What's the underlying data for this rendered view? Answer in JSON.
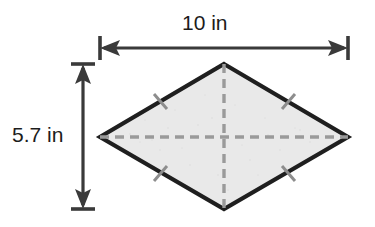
{
  "figure": {
    "name": "rhombus-diagonals-diagram",
    "shape_label": "rhombus",
    "fill_color": "#e9e9e9",
    "outline_color": "#1f1f1f",
    "dash_color": "#9a9a9a",
    "tick_color": "#8d8d8d",
    "dimension_color": "#3a3a3a",
    "background_color": "#ffffff",
    "vertices": {
      "top": [
        224,
        64
      ],
      "right": [
        348,
        137
      ],
      "bottom": [
        224,
        209
      ],
      "left": [
        100,
        137
      ]
    },
    "diagonals": [
      {
        "name": "horizontal-diagonal",
        "style": "dashed",
        "from": [
          100,
          137
        ],
        "to": [
          348,
          137
        ]
      },
      {
        "name": "vertical-diagonal",
        "style": "dashed",
        "from": [
          224,
          64
        ],
        "to": [
          224,
          209
        ]
      }
    ],
    "congruence_ticks": [
      {
        "name": "tick-top-left-edge",
        "at": [
          160,
          101
        ]
      },
      {
        "name": "tick-top-right-edge",
        "at": [
          288,
          101
        ]
      },
      {
        "name": "tick-bottom-left-edge",
        "at": [
          160,
          173
        ]
      },
      {
        "name": "tick-bottom-right-edge",
        "at": [
          288,
          173
        ]
      }
    ]
  },
  "dimensions": {
    "width": {
      "label": "10 in",
      "value": 10,
      "unit": "in",
      "orientation": "horizontal",
      "line_y": 48,
      "from_x": 100,
      "to_x": 348
    },
    "height": {
      "label": "5.7 in",
      "value": 5.7,
      "unit": "in",
      "orientation": "vertical",
      "line_x": 83,
      "from_y": 64,
      "to_y": 209
    }
  }
}
